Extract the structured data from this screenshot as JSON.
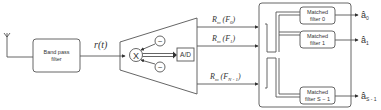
{
  "diagram": {
    "antenna": {
      "label": ""
    },
    "bandpass_filter": {
      "line1": "Band pass",
      "line2": "filter"
    },
    "signal_label": "r(t)",
    "mixer": {
      "symbol": "X"
    },
    "oscillators": [
      "~",
      "~"
    ],
    "adc": {
      "label": "A/D"
    },
    "channels": [
      {
        "label": "R",
        "sub": "m",
        "arg": "F",
        "arg_sub": "0"
      },
      {
        "label": "R",
        "sub": "m",
        "arg": "F",
        "arg_sub": "1"
      },
      {
        "label": "R",
        "sub": "m",
        "arg": "F",
        "arg_sub": "N - 1"
      }
    ],
    "matched_filters": [
      {
        "line1": "Matched",
        "line2": "filter 0",
        "output": "â",
        "output_sub": "0"
      },
      {
        "line1": "Matched",
        "line2": "filter 1",
        "output": "â",
        "output_sub": "1"
      },
      {
        "line1": "Matched",
        "line2": "filter S − 1",
        "output": "â",
        "output_sub": "S - 1"
      }
    ]
  }
}
